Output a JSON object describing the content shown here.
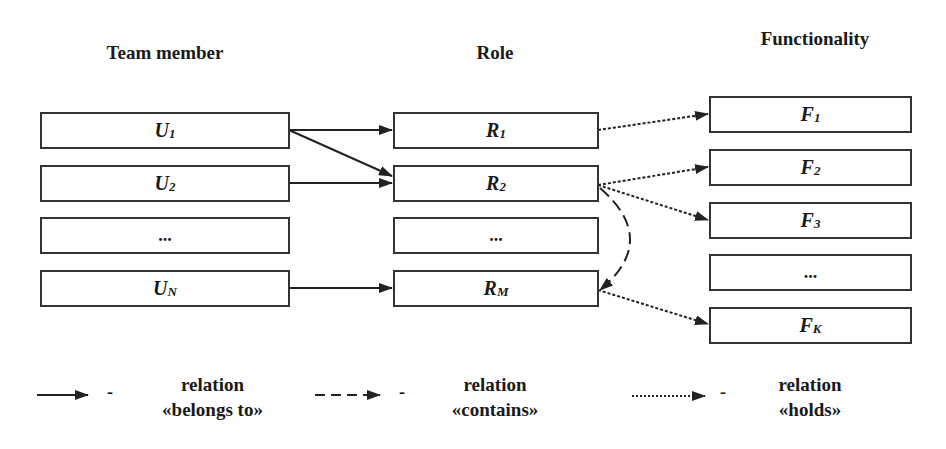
{
  "headings": {
    "team_member": "Team member",
    "role": "Role",
    "functionality": "Functionality"
  },
  "team_members": [
    {
      "base": "U",
      "sub": "1"
    },
    {
      "base": "U",
      "sub": "2"
    },
    {
      "base": "...",
      "sub": ""
    },
    {
      "base": "U",
      "sub": "N"
    }
  ],
  "roles": [
    {
      "base": "R",
      "sub": "1"
    },
    {
      "base": "R",
      "sub": "2"
    },
    {
      "base": "...",
      "sub": ""
    },
    {
      "base": "R",
      "sub": "M"
    }
  ],
  "functionalities": [
    {
      "base": "F",
      "sub": "1"
    },
    {
      "base": "F",
      "sub": "2"
    },
    {
      "base": "F",
      "sub": "3"
    },
    {
      "base": "...",
      "sub": ""
    },
    {
      "base": "F",
      "sub": "K"
    }
  ],
  "edges": [
    {
      "from": "U1",
      "to": "R1",
      "type": "belongs_to"
    },
    {
      "from": "U1",
      "to": "R2",
      "type": "belongs_to"
    },
    {
      "from": "U2",
      "to": "R2",
      "type": "belongs_to"
    },
    {
      "from": "UN",
      "to": "RM",
      "type": "belongs_to"
    },
    {
      "from": "R1",
      "to": "F1",
      "type": "holds"
    },
    {
      "from": "R2",
      "to": "F2",
      "type": "holds"
    },
    {
      "from": "R2",
      "to": "F3",
      "type": "holds"
    },
    {
      "from": "RM",
      "to": "FK",
      "type": "holds"
    },
    {
      "from": "R2",
      "to": "RM",
      "type": "contains"
    }
  ],
  "legend": [
    {
      "style": "solid",
      "dash": "-",
      "line1": "relation",
      "line2": "«belongs to»"
    },
    {
      "style": "dashed",
      "dash": "-",
      "line1": "relation",
      "line2": "«contains»"
    },
    {
      "style": "dotted",
      "dash": "-",
      "line1": "relation",
      "line2": "«holds»"
    }
  ]
}
